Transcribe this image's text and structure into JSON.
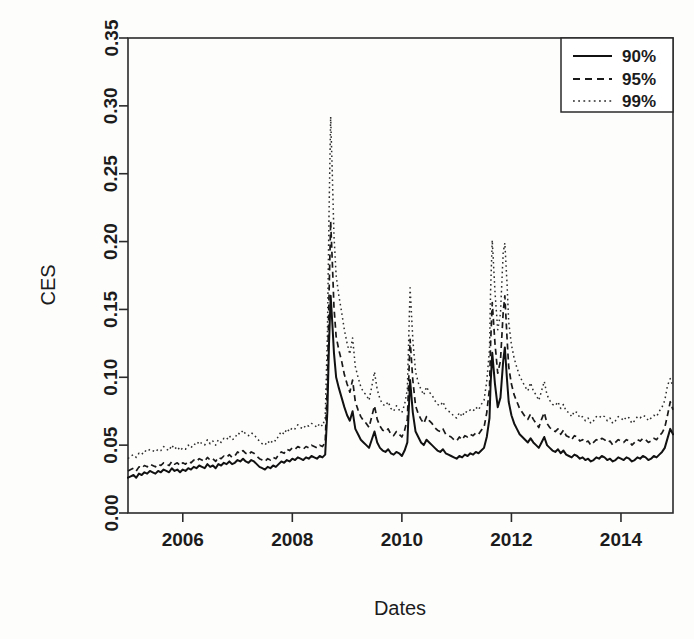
{
  "chart_data": {
    "type": "line",
    "title": "",
    "xlabel": "Dates",
    "ylabel": "CES",
    "xlim": [
      2005.0,
      2014.95
    ],
    "ylim": [
      0.0,
      0.35
    ],
    "grid": false,
    "legend_position": "top-right",
    "xticks": [
      2006,
      2008,
      2010,
      2012,
      2014
    ],
    "xtick_labels": [
      "2006",
      "2008",
      "2010",
      "2012",
      "2014"
    ],
    "yticks": [
      0.0,
      0.05,
      0.1,
      0.15,
      0.2,
      0.25,
      0.3,
      0.35
    ],
    "ytick_labels": [
      "0.00",
      "0.05",
      "0.10",
      "0.15",
      "0.20",
      "0.25",
      "0.30",
      "0.35"
    ],
    "legend": [
      {
        "label": "90%",
        "style": "solid"
      },
      {
        "label": "95%",
        "style": "dashed"
      },
      {
        "label": "99%",
        "style": "dotted"
      }
    ],
    "x": [
      2005.0,
      2005.05,
      2005.1,
      2005.15,
      2005.2,
      2005.25,
      2005.3,
      2005.35,
      2005.4,
      2005.45,
      2005.5,
      2005.55,
      2005.6,
      2005.65,
      2005.7,
      2005.75,
      2005.8,
      2005.85,
      2005.9,
      2005.95,
      2006.0,
      2006.05,
      2006.1,
      2006.15,
      2006.2,
      2006.25,
      2006.3,
      2006.35,
      2006.4,
      2006.45,
      2006.5,
      2006.55,
      2006.6,
      2006.65,
      2006.7,
      2006.75,
      2006.8,
      2006.85,
      2006.9,
      2006.95,
      2007.0,
      2007.05,
      2007.1,
      2007.15,
      2007.2,
      2007.25,
      2007.3,
      2007.35,
      2007.4,
      2007.45,
      2007.5,
      2007.55,
      2007.6,
      2007.65,
      2007.7,
      2007.75,
      2007.8,
      2007.85,
      2007.9,
      2007.95,
      2008.0,
      2008.05,
      2008.1,
      2008.15,
      2008.2,
      2008.25,
      2008.3,
      2008.35,
      2008.4,
      2008.45,
      2008.5,
      2008.55,
      2008.6,
      2008.64,
      2008.67,
      2008.7,
      2008.73,
      2008.76,
      2008.8,
      2008.85,
      2008.9,
      2008.95,
      2009.0,
      2009.05,
      2009.1,
      2009.15,
      2009.2,
      2009.25,
      2009.3,
      2009.35,
      2009.4,
      2009.45,
      2009.5,
      2009.55,
      2009.6,
      2009.65,
      2009.7,
      2009.75,
      2009.8,
      2009.85,
      2009.9,
      2009.95,
      2010.0,
      2010.05,
      2010.1,
      2010.15,
      2010.2,
      2010.25,
      2010.3,
      2010.35,
      2010.4,
      2010.45,
      2010.5,
      2010.55,
      2010.6,
      2010.65,
      2010.7,
      2010.75,
      2010.8,
      2010.85,
      2010.9,
      2010.95,
      2011.0,
      2011.05,
      2011.1,
      2011.15,
      2011.2,
      2011.25,
      2011.3,
      2011.35,
      2011.4,
      2011.45,
      2011.5,
      2011.55,
      2011.6,
      2011.62,
      2011.65,
      2011.7,
      2011.75,
      2011.8,
      2011.85,
      2011.88,
      2011.92,
      2011.95,
      2012.0,
      2012.05,
      2012.1,
      2012.15,
      2012.2,
      2012.25,
      2012.3,
      2012.35,
      2012.4,
      2012.45,
      2012.5,
      2012.55,
      2012.6,
      2012.65,
      2012.7,
      2012.75,
      2012.8,
      2012.85,
      2012.9,
      2012.95,
      2013.0,
      2013.05,
      2013.1,
      2013.15,
      2013.2,
      2013.25,
      2013.3,
      2013.35,
      2013.4,
      2013.45,
      2013.5,
      2013.55,
      2013.6,
      2013.65,
      2013.7,
      2013.75,
      2013.8,
      2013.85,
      2013.9,
      2013.95,
      2014.0,
      2014.05,
      2014.1,
      2014.15,
      2014.2,
      2014.25,
      2014.3,
      2014.35,
      2014.4,
      2014.45,
      2014.5,
      2014.55,
      2014.6,
      2014.65,
      2014.7,
      2014.75,
      2014.8,
      2014.85,
      2014.9,
      2014.95
    ],
    "series": [
      {
        "name": "90%",
        "style": "solid",
        "values": [
          0.026,
          0.027,
          0.028,
          0.026,
          0.029,
          0.028,
          0.03,
          0.029,
          0.031,
          0.03,
          0.029,
          0.031,
          0.03,
          0.032,
          0.031,
          0.03,
          0.033,
          0.031,
          0.032,
          0.03,
          0.032,
          0.031,
          0.033,
          0.032,
          0.034,
          0.033,
          0.035,
          0.034,
          0.033,
          0.036,
          0.034,
          0.035,
          0.033,
          0.036,
          0.035,
          0.037,
          0.036,
          0.038,
          0.036,
          0.037,
          0.039,
          0.038,
          0.04,
          0.038,
          0.037,
          0.039,
          0.038,
          0.036,
          0.034,
          0.033,
          0.032,
          0.034,
          0.033,
          0.035,
          0.034,
          0.036,
          0.038,
          0.037,
          0.039,
          0.038,
          0.04,
          0.039,
          0.041,
          0.04,
          0.039,
          0.041,
          0.04,
          0.042,
          0.041,
          0.04,
          0.042,
          0.041,
          0.043,
          0.075,
          0.125,
          0.16,
          0.14,
          0.118,
          0.1,
          0.092,
          0.085,
          0.078,
          0.072,
          0.068,
          0.075,
          0.062,
          0.058,
          0.054,
          0.052,
          0.05,
          0.048,
          0.054,
          0.06,
          0.052,
          0.048,
          0.046,
          0.045,
          0.047,
          0.044,
          0.043,
          0.045,
          0.044,
          0.042,
          0.046,
          0.052,
          0.098,
          0.074,
          0.06,
          0.056,
          0.052,
          0.05,
          0.054,
          0.052,
          0.05,
          0.048,
          0.046,
          0.045,
          0.047,
          0.044,
          0.043,
          0.042,
          0.041,
          0.04,
          0.042,
          0.041,
          0.043,
          0.042,
          0.044,
          0.043,
          0.045,
          0.044,
          0.046,
          0.048,
          0.056,
          0.07,
          0.095,
          0.118,
          0.095,
          0.078,
          0.085,
          0.112,
          0.122,
          0.098,
          0.082,
          0.072,
          0.066,
          0.062,
          0.058,
          0.056,
          0.054,
          0.052,
          0.055,
          0.052,
          0.05,
          0.048,
          0.052,
          0.056,
          0.05,
          0.048,
          0.046,
          0.045,
          0.047,
          0.044,
          0.046,
          0.043,
          0.042,
          0.041,
          0.043,
          0.042,
          0.04,
          0.041,
          0.039,
          0.04,
          0.038,
          0.039,
          0.041,
          0.04,
          0.042,
          0.041,
          0.039,
          0.04,
          0.038,
          0.039,
          0.041,
          0.04,
          0.039,
          0.041,
          0.04,
          0.038,
          0.039,
          0.041,
          0.04,
          0.042,
          0.041,
          0.039,
          0.04,
          0.042,
          0.041,
          0.043,
          0.045,
          0.048,
          0.055,
          0.062,
          0.058
        ]
      },
      {
        "name": "95%",
        "style": "dashed",
        "values": [
          0.031,
          0.032,
          0.033,
          0.031,
          0.034,
          0.033,
          0.035,
          0.034,
          0.036,
          0.035,
          0.034,
          0.036,
          0.035,
          0.037,
          0.036,
          0.035,
          0.038,
          0.036,
          0.037,
          0.035,
          0.037,
          0.036,
          0.038,
          0.037,
          0.039,
          0.038,
          0.04,
          0.039,
          0.038,
          0.041,
          0.039,
          0.04,
          0.038,
          0.041,
          0.04,
          0.042,
          0.041,
          0.043,
          0.041,
          0.042,
          0.045,
          0.044,
          0.046,
          0.044,
          0.043,
          0.045,
          0.044,
          0.042,
          0.04,
          0.039,
          0.038,
          0.04,
          0.039,
          0.041,
          0.04,
          0.043,
          0.045,
          0.044,
          0.047,
          0.046,
          0.048,
          0.047,
          0.049,
          0.048,
          0.047,
          0.049,
          0.048,
          0.05,
          0.049,
          0.048,
          0.05,
          0.049,
          0.052,
          0.095,
          0.16,
          0.215,
          0.185,
          0.152,
          0.13,
          0.12,
          0.112,
          0.102,
          0.095,
          0.089,
          0.098,
          0.082,
          0.076,
          0.071,
          0.068,
          0.066,
          0.063,
          0.071,
          0.079,
          0.069,
          0.064,
          0.061,
          0.06,
          0.062,
          0.058,
          0.057,
          0.06,
          0.058,
          0.056,
          0.061,
          0.069,
          0.128,
          0.098,
          0.079,
          0.073,
          0.069,
          0.066,
          0.071,
          0.068,
          0.066,
          0.063,
          0.061,
          0.06,
          0.062,
          0.058,
          0.057,
          0.056,
          0.054,
          0.053,
          0.056,
          0.054,
          0.057,
          0.056,
          0.058,
          0.057,
          0.059,
          0.058,
          0.061,
          0.063,
          0.074,
          0.092,
          0.125,
          0.155,
          0.125,
          0.103,
          0.112,
          0.148,
          0.16,
          0.129,
          0.108,
          0.095,
          0.087,
          0.082,
          0.077,
          0.074,
          0.071,
          0.069,
          0.073,
          0.069,
          0.066,
          0.063,
          0.069,
          0.074,
          0.066,
          0.063,
          0.061,
          0.06,
          0.062,
          0.058,
          0.061,
          0.057,
          0.056,
          0.054,
          0.057,
          0.056,
          0.053,
          0.054,
          0.052,
          0.053,
          0.05,
          0.052,
          0.054,
          0.053,
          0.055,
          0.054,
          0.052,
          0.053,
          0.05,
          0.052,
          0.054,
          0.053,
          0.052,
          0.054,
          0.053,
          0.05,
          0.052,
          0.054,
          0.053,
          0.055,
          0.054,
          0.052,
          0.053,
          0.055,
          0.054,
          0.057,
          0.059,
          0.063,
          0.072,
          0.082,
          0.076
        ]
      },
      {
        "name": "99%",
        "style": "dotted",
        "values": [
          0.04,
          0.042,
          0.043,
          0.041,
          0.044,
          0.043,
          0.046,
          0.045,
          0.047,
          0.046,
          0.045,
          0.047,
          0.046,
          0.049,
          0.047,
          0.046,
          0.05,
          0.047,
          0.049,
          0.046,
          0.048,
          0.047,
          0.05,
          0.048,
          0.051,
          0.05,
          0.053,
          0.051,
          0.05,
          0.054,
          0.051,
          0.053,
          0.05,
          0.054,
          0.052,
          0.055,
          0.054,
          0.057,
          0.054,
          0.055,
          0.059,
          0.058,
          0.061,
          0.058,
          0.057,
          0.059,
          0.058,
          0.055,
          0.053,
          0.051,
          0.05,
          0.053,
          0.051,
          0.054,
          0.053,
          0.057,
          0.06,
          0.058,
          0.062,
          0.06,
          0.063,
          0.062,
          0.065,
          0.063,
          0.062,
          0.065,
          0.064,
          0.066,
          0.065,
          0.063,
          0.066,
          0.064,
          0.07,
          0.13,
          0.22,
          0.292,
          0.25,
          0.205,
          0.175,
          0.16,
          0.148,
          0.135,
          0.125,
          0.117,
          0.129,
          0.108,
          0.1,
          0.093,
          0.089,
          0.087,
          0.083,
          0.093,
          0.104,
          0.091,
          0.084,
          0.08,
          0.079,
          0.082,
          0.077,
          0.075,
          0.079,
          0.076,
          0.074,
          0.08,
          0.091,
          0.166,
          0.128,
          0.104,
          0.096,
          0.091,
          0.087,
          0.093,
          0.089,
          0.087,
          0.083,
          0.08,
          0.079,
          0.082,
          0.077,
          0.075,
          0.074,
          0.071,
          0.07,
          0.074,
          0.071,
          0.075,
          0.074,
          0.076,
          0.075,
          0.078,
          0.076,
          0.08,
          0.083,
          0.097,
          0.121,
          0.164,
          0.201,
          0.163,
          0.135,
          0.147,
          0.192,
          0.199,
          0.169,
          0.141,
          0.124,
          0.114,
          0.107,
          0.101,
          0.097,
          0.093,
          0.09,
          0.096,
          0.09,
          0.087,
          0.083,
          0.09,
          0.097,
          0.087,
          0.083,
          0.08,
          0.079,
          0.082,
          0.077,
          0.08,
          0.075,
          0.074,
          0.071,
          0.075,
          0.074,
          0.07,
          0.071,
          0.068,
          0.07,
          0.066,
          0.068,
          0.071,
          0.07,
          0.072,
          0.071,
          0.068,
          0.07,
          0.066,
          0.068,
          0.071,
          0.07,
          0.068,
          0.071,
          0.07,
          0.066,
          0.068,
          0.071,
          0.07,
          0.072,
          0.071,
          0.068,
          0.07,
          0.072,
          0.071,
          0.075,
          0.078,
          0.083,
          0.094,
          0.099,
          0.093
        ]
      }
    ]
  }
}
